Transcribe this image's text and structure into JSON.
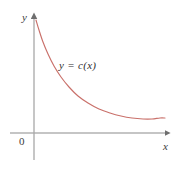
{
  "figure": {
    "background_color": "#ffffff",
    "axis_color": "#8c8c8c",
    "text_color": "#3b3b3b",
    "curve_color": "#c9706a"
  },
  "labels": {
    "y_axis": "y",
    "x_axis": "x",
    "origin": "0",
    "curve": "y = c(x)"
  },
  "chart_data": {
    "type": "line",
    "title": "",
    "subtitle": "",
    "xlabel": "x",
    "ylabel": "y",
    "legend": [],
    "legend_position": "none",
    "grid": false,
    "annotations": [
      {
        "text": "y = c(x)",
        "x_px": 85,
        "y_px": 68,
        "describes": "curve"
      },
      {
        "text": "0",
        "x_px": 23,
        "y_px": 141,
        "describes": "origin"
      }
    ],
    "axes": {
      "x_axis_y_px": 133,
      "y_axis_x_px": 34,
      "x_axis_start_px": 10,
      "x_axis_end_px": 168,
      "y_axis_top_px": 16,
      "y_axis_bottom_px": 160,
      "arrowheads": [
        "x-positive",
        "y-positive"
      ],
      "tick_labels_x": [],
      "tick_labels_y": [],
      "xlim": [
        0,
        1
      ],
      "ylim": [
        0,
        1
      ]
    },
    "series": [
      {
        "name": "c(x)",
        "color": "#c9706a",
        "description": "Average cost curve: decreasing, convex, steep near the y-axis, flattening to a shallow minimum near the right, then rising very slightly.",
        "points_px": [
          [
            36,
            20
          ],
          [
            39,
            30
          ],
          [
            43,
            42
          ],
          [
            48,
            54
          ],
          [
            54,
            66
          ],
          [
            61,
            77
          ],
          [
            69,
            87
          ],
          [
            78,
            96
          ],
          [
            88,
            103
          ],
          [
            99,
            109
          ],
          [
            110,
            113
          ],
          [
            121,
            116
          ],
          [
            132,
            118
          ],
          [
            143,
            119
          ],
          [
            152,
            119
          ],
          [
            160,
            118
          ],
          [
            165,
            118
          ]
        ]
      }
    ]
  }
}
